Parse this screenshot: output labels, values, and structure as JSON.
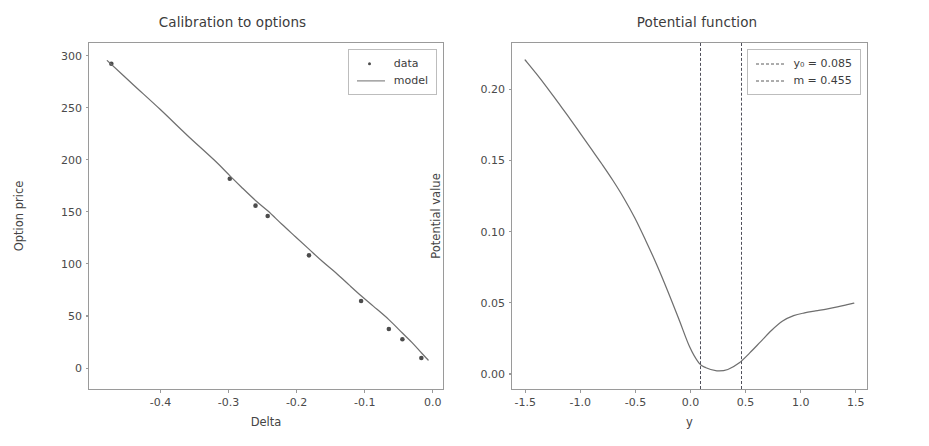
{
  "figure": {
    "width": 929,
    "height": 446,
    "background": "#ffffff",
    "line_color": "#6f6f6f",
    "marker_color": "#4c4c4c",
    "vline_color": "#4f4f5a",
    "axis_color": "#9a9a9a"
  },
  "chart_data": [
    {
      "type": "scatter",
      "title": "Calibration to options",
      "xlabel": "Delta",
      "ylabel": "Option price",
      "xlim": [
        -0.505,
        0.018
      ],
      "ylim": [
        -22,
        312
      ],
      "xticks": [
        "-0.4",
        "-0.3",
        "-0.2",
        "-0.1",
        "0.0"
      ],
      "xtick_values": [
        -0.4,
        -0.3,
        -0.2,
        -0.1,
        0.0
      ],
      "yticks": [
        "0",
        "50",
        "100",
        "150",
        "200",
        "250",
        "300"
      ],
      "ytick_values": [
        0,
        50,
        100,
        150,
        200,
        250,
        300
      ],
      "grid": false,
      "legend_position": "upper right",
      "legend": [
        "data",
        "model"
      ],
      "series": [
        {
          "name": "data",
          "style": "markers",
          "x": [
            -0.472,
            -0.297,
            -0.259,
            -0.241,
            -0.18,
            -0.103,
            -0.062,
            -0.042,
            -0.014
          ],
          "y": [
            292,
            181,
            155,
            145,
            107,
            63,
            36,
            26,
            8
          ]
        },
        {
          "name": "model",
          "style": "line",
          "x": [
            -0.478,
            -0.44,
            -0.4,
            -0.36,
            -0.32,
            -0.297,
            -0.28,
            -0.259,
            -0.241,
            -0.22,
            -0.2,
            -0.18,
            -0.16,
            -0.14,
            -0.12,
            -0.103,
            -0.085,
            -0.062,
            -0.042,
            -0.028,
            -0.014,
            -0.004
          ],
          "y": [
            295,
            272,
            248,
            223,
            199,
            184,
            173,
            160,
            150,
            137,
            125,
            113,
            101,
            90,
            78,
            68,
            58,
            45,
            32,
            23,
            13,
            6
          ]
        }
      ]
    },
    {
      "type": "line",
      "title": "Potential function",
      "xlabel": "y",
      "ylabel": "Potential value",
      "xlim": [
        -1.62,
        1.62
      ],
      "ylim": [
        -0.012,
        0.2325
      ],
      "xticks": [
        "-1.5",
        "-1.0",
        "-0.5",
        "0.0",
        "0.5",
        "1.0",
        "1.5"
      ],
      "xtick_values": [
        -1.5,
        -1.0,
        -0.5,
        0.0,
        0.5,
        1.0,
        1.5
      ],
      "yticks": [
        "0.00",
        "0.05",
        "0.10",
        "0.15",
        "0.20"
      ],
      "ytick_values": [
        0.0,
        0.05,
        0.1,
        0.15,
        0.2
      ],
      "grid": false,
      "legend_position": "upper right",
      "legend": [
        "y₀ = 0.085",
        "m = 0.455"
      ],
      "annotations": [
        {
          "label": "y0",
          "label_text": "y₀ = 0.085",
          "value": 0.085,
          "style": "dashdot-vline"
        },
        {
          "label": "m",
          "label_text": "m = 0.455",
          "value": 0.455,
          "style": "dashdot-vline"
        }
      ],
      "series": [
        {
          "name": "potential",
          "style": "line",
          "x": [
            -1.5,
            -1.4,
            -1.3,
            -1.2,
            -1.1,
            -1.0,
            -0.9,
            -0.8,
            -0.7,
            -0.6,
            -0.5,
            -0.4,
            -0.3,
            -0.2,
            -0.1,
            0.0,
            0.085,
            0.15,
            0.25,
            0.35,
            0.455,
            0.55,
            0.65,
            0.75,
            0.85,
            0.95,
            1.05,
            1.15,
            1.25,
            1.35,
            1.45,
            1.5
          ],
          "y": [
            0.2205,
            0.211,
            0.201,
            0.1905,
            0.18,
            0.169,
            0.158,
            0.147,
            0.1355,
            0.123,
            0.109,
            0.093,
            0.076,
            0.0575,
            0.038,
            0.018,
            0.0065,
            0.003,
            0.0008,
            0.0018,
            0.0065,
            0.0135,
            0.0215,
            0.0295,
            0.036,
            0.0398,
            0.0418,
            0.0432,
            0.0445,
            0.046,
            0.0478,
            0.0487
          ]
        }
      ]
    }
  ],
  "panels": {
    "left": {
      "title": "Calibration to options",
      "xlabel": "Delta",
      "ylabel": "Option price",
      "legend": {
        "items": [
          {
            "label": "data",
            "key": "marker-dot"
          },
          {
            "label": "model",
            "key": "solid-line"
          }
        ]
      }
    },
    "right": {
      "title": "Potential function",
      "xlabel": "y",
      "ylabel": "Potential value",
      "legend": {
        "items": [
          {
            "label": "y₀ = 0.085",
            "key": "dashdot-line"
          },
          {
            "label": "m = 0.455",
            "key": "dashdot-line"
          }
        ]
      }
    }
  }
}
